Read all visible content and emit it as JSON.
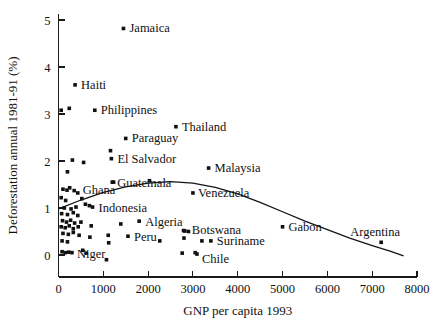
{
  "chart_data": {
    "type": "scatter",
    "title": "",
    "xlabel": "GNP per capita 1993",
    "ylabel": "Deforestation annual 1981-91 (%)",
    "xlim": [
      0,
      8000
    ],
    "ylim": [
      -0.3,
      5.2
    ],
    "xticks": [
      0,
      1000,
      2000,
      3000,
      4000,
      5000,
      6000,
      7000,
      8000
    ],
    "xtick_labels": [
      "0",
      "1000",
      "2000",
      "3000",
      "4000",
      "5000",
      "6000",
      "7000",
      "8000"
    ],
    "yticks": [
      0,
      1,
      2,
      3,
      4,
      5
    ],
    "ytick_labels": [
      "0",
      "1",
      "2",
      "3",
      "4",
      "5"
    ],
    "grid": false,
    "legend": "none",
    "marker": "square",
    "marker_color": "#111111",
    "curve_color": "#141414",
    "labeled_points": [
      {
        "label": "Jamaica",
        "x": 1450,
        "y": 4.82
      },
      {
        "label": "Haiti",
        "x": 370,
        "y": 3.62
      },
      {
        "label": "Philippines",
        "x": 810,
        "y": 3.08
      },
      {
        "label": "Thailand",
        "x": 2620,
        "y": 2.73
      },
      {
        "label": "Paraguay",
        "x": 1500,
        "y": 2.48
      },
      {
        "label": "El Salvador",
        "x": 1180,
        "y": 2.05
      },
      {
        "label": "Malaysia",
        "x": 3350,
        "y": 1.85
      },
      {
        "label": "Guatemala",
        "x": 1200,
        "y": 1.55
      },
      {
        "label": "Ghana",
        "x": 430,
        "y": 1.32
      },
      {
        "label": "Venezuela",
        "x": 3000,
        "y": 1.32
      },
      {
        "label": "Indonesia",
        "x": 760,
        "y": 1.02
      },
      {
        "label": "Algeria",
        "x": 1800,
        "y": 0.72
      },
      {
        "label": "Gabon",
        "x": 5000,
        "y": 0.6
      },
      {
        "label": "Botswana",
        "x": 2820,
        "y": 0.51
      },
      {
        "label": "Peru",
        "x": 1550,
        "y": 0.4
      },
      {
        "label": "Suriname",
        "x": 3400,
        "y": 0.3
      },
      {
        "label": "Argentina",
        "x": 7200,
        "y": 0.27
      },
      {
        "label": "Niger",
        "x": 300,
        "y": 0.05
      },
      {
        "label": "Chile",
        "x": 3090,
        "y": 0.02
      }
    ],
    "unlabeled_points": [
      {
        "x": 60,
        "y": 3.08
      },
      {
        "x": 240,
        "y": 3.12
      },
      {
        "x": 310,
        "y": 2.02
      },
      {
        "x": 200,
        "y": 1.77
      },
      {
        "x": 560,
        "y": 1.97
      },
      {
        "x": 1160,
        "y": 2.22
      },
      {
        "x": 1230,
        "y": 1.55
      },
      {
        "x": 2030,
        "y": 1.58
      },
      {
        "x": 100,
        "y": 1.4
      },
      {
        "x": 190,
        "y": 1.38
      },
      {
        "x": 250,
        "y": 1.43
      },
      {
        "x": 350,
        "y": 1.37
      },
      {
        "x": 60,
        "y": 1.22
      },
      {
        "x": 160,
        "y": 1.16
      },
      {
        "x": 520,
        "y": 1.2
      },
      {
        "x": 600,
        "y": 1.08
      },
      {
        "x": 690,
        "y": 1.05
      },
      {
        "x": 130,
        "y": 1.0
      },
      {
        "x": 280,
        "y": 0.98
      },
      {
        "x": 390,
        "y": 1.02
      },
      {
        "x": 70,
        "y": 0.88
      },
      {
        "x": 200,
        "y": 0.86
      },
      {
        "x": 330,
        "y": 0.9
      },
      {
        "x": 430,
        "y": 0.84
      },
      {
        "x": 90,
        "y": 0.73
      },
      {
        "x": 180,
        "y": 0.7
      },
      {
        "x": 270,
        "y": 0.74
      },
      {
        "x": 360,
        "y": 0.68
      },
      {
        "x": 500,
        "y": 0.7
      },
      {
        "x": 60,
        "y": 0.6
      },
      {
        "x": 150,
        "y": 0.58
      },
      {
        "x": 240,
        "y": 0.62
      },
      {
        "x": 330,
        "y": 0.56
      },
      {
        "x": 440,
        "y": 0.6
      },
      {
        "x": 730,
        "y": 0.62
      },
      {
        "x": 1390,
        "y": 0.66
      },
      {
        "x": 100,
        "y": 0.46
      },
      {
        "x": 220,
        "y": 0.44
      },
      {
        "x": 330,
        "y": 0.48
      },
      {
        "x": 460,
        "y": 0.42
      },
      {
        "x": 700,
        "y": 0.38
      },
      {
        "x": 1110,
        "y": 0.42
      },
      {
        "x": 80,
        "y": 0.3
      },
      {
        "x": 200,
        "y": 0.28
      },
      {
        "x": 1120,
        "y": 0.26
      },
      {
        "x": 2260,
        "y": 0.3
      },
      {
        "x": 2790,
        "y": 0.52
      },
      {
        "x": 2900,
        "y": 0.5
      },
      {
        "x": 2800,
        "y": 0.36
      },
      {
        "x": 3200,
        "y": 0.3
      },
      {
        "x": 80,
        "y": 0.07
      },
      {
        "x": 150,
        "y": 0.05
      },
      {
        "x": 230,
        "y": 0.06
      },
      {
        "x": 540,
        "y": 0.1
      },
      {
        "x": 620,
        "y": 0.04
      },
      {
        "x": 2760,
        "y": 0.04
      },
      {
        "x": 3050,
        "y": 0.05
      },
      {
        "x": 1070,
        "y": -0.1
      }
    ],
    "fit_curve": {
      "description": "downward-opening quadratic trend line",
      "points": [
        {
          "x": 0,
          "y": 0.98
        },
        {
          "x": 500,
          "y": 1.17
        },
        {
          "x": 1000,
          "y": 1.33
        },
        {
          "x": 1500,
          "y": 1.45
        },
        {
          "x": 2000,
          "y": 1.53
        },
        {
          "x": 2500,
          "y": 1.56
        },
        {
          "x": 3000,
          "y": 1.53
        },
        {
          "x": 3500,
          "y": 1.44
        },
        {
          "x": 4000,
          "y": 1.3
        },
        {
          "x": 4500,
          "y": 1.12
        },
        {
          "x": 5000,
          "y": 0.92
        },
        {
          "x": 5500,
          "y": 0.72
        },
        {
          "x": 6000,
          "y": 0.54
        },
        {
          "x": 6500,
          "y": 0.36
        },
        {
          "x": 7000,
          "y": 0.2
        },
        {
          "x": 7400,
          "y": 0.08
        },
        {
          "x": 7700,
          "y": -0.02
        }
      ]
    }
  }
}
